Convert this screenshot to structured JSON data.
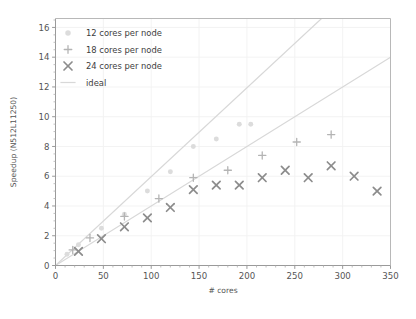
{
  "chart_data": {
    "type": "scatter",
    "title": "",
    "xlabel": "# cores",
    "ylabel": "Speedup (N512L11250)",
    "xlim": [
      0,
      350
    ],
    "ylim": [
      0,
      16.6
    ],
    "xticks": [
      0,
      50,
      100,
      150,
      200,
      250,
      300,
      350
    ],
    "yticks": [
      2,
      4,
      6,
      8,
      10,
      12,
      14,
      16
    ],
    "xtick_labels": [
      "0",
      "50",
      "100",
      "150",
      "200",
      "250",
      "300",
      "350"
    ],
    "ytick_labels": [
      "2",
      "4",
      "6",
      "8",
      "10",
      "12",
      "14",
      "16"
    ],
    "grid": true,
    "legend_position": "upper left",
    "series": [
      {
        "name": "12 cores per node",
        "marker": "circle",
        "color": "#dcdcdc",
        "points": [
          {
            "x": 12,
            "y": 0.75
          },
          {
            "x": 24,
            "y": 1.4
          },
          {
            "x": 48,
            "y": 2.5
          },
          {
            "x": 72,
            "y": 3.45
          },
          {
            "x": 96,
            "y": 5.0
          },
          {
            "x": 120,
            "y": 6.3
          },
          {
            "x": 144,
            "y": 8.0
          },
          {
            "x": 168,
            "y": 8.5
          },
          {
            "x": 192,
            "y": 9.5
          },
          {
            "x": 204,
            "y": 9.5
          }
        ]
      },
      {
        "name": "18 cores per node",
        "marker": "plus",
        "color": "#b4b4b4",
        "points": [
          {
            "x": 18,
            "y": 1.05
          },
          {
            "x": 36,
            "y": 1.85
          },
          {
            "x": 72,
            "y": 3.3
          },
          {
            "x": 108,
            "y": 4.5
          },
          {
            "x": 144,
            "y": 5.9
          },
          {
            "x": 180,
            "y": 6.4
          },
          {
            "x": 216,
            "y": 7.4
          },
          {
            "x": 252,
            "y": 8.3
          },
          {
            "x": 288,
            "y": 8.8
          }
        ]
      },
      {
        "name": "24 cores per node",
        "marker": "x",
        "color": "#8c8c8c",
        "points": [
          {
            "x": 24,
            "y": 0.95
          },
          {
            "x": 48,
            "y": 1.8
          },
          {
            "x": 72,
            "y": 2.6
          },
          {
            "x": 96,
            "y": 3.2
          },
          {
            "x": 120,
            "y": 3.9
          },
          {
            "x": 144,
            "y": 5.1
          },
          {
            "x": 168,
            "y": 5.4
          },
          {
            "x": 192,
            "y": 5.4
          },
          {
            "x": 216,
            "y": 5.9
          },
          {
            "x": 240,
            "y": 6.4
          },
          {
            "x": 264,
            "y": 5.9
          },
          {
            "x": 288,
            "y": 6.7
          },
          {
            "x": 312,
            "y": 6.0
          },
          {
            "x": 336,
            "y": 5.0
          }
        ]
      }
    ],
    "reference_lines": [
      {
        "name": "ideal",
        "color": "#d8d8d8",
        "from": {
          "x": 0,
          "y": 0
        },
        "to": {
          "x": 278,
          "y": 16.6
        }
      },
      {
        "name": "ideal",
        "color": "#d8d8d8",
        "from": {
          "x": 0,
          "y": 0
        },
        "to": {
          "x": 350,
          "y": 14.0
        }
      }
    ],
    "legend": [
      {
        "label": "12 cores per node",
        "marker": "circle",
        "color": "#dcdcdc"
      },
      {
        "label": "18 cores per node",
        "marker": "plus",
        "color": "#b4b4b4"
      },
      {
        "label": "24 cores per node",
        "marker": "x",
        "color": "#8c8c8c"
      },
      {
        "label": "ideal",
        "marker": "line",
        "color": "#d8d8d8"
      }
    ]
  }
}
